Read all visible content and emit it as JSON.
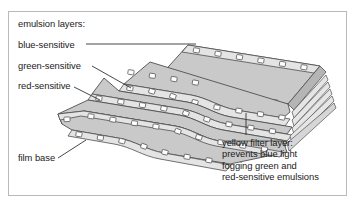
{
  "figure": {
    "border_color": "#b9b9b9",
    "background_color": "#ffffff"
  },
  "labels": {
    "emulsion_layers": "emulsion layers:",
    "blue_sensitive": "blue-sensitive",
    "green_sensitive": "green-sensitive",
    "red_sensitive": "red-sensitive",
    "film_base": "film base",
    "yellow_filter": {
      "line1": "yellow filter layer:",
      "line2": "prevents blue light",
      "line3": "fogging green and",
      "line4": "red-sensitive emulsions"
    }
  },
  "diagram": {
    "type": "exploded-layer-illustration",
    "layer_count": 4,
    "layers": [
      {
        "name": "blue-sensitive",
        "order": 1,
        "fill": "#c9c9c9"
      },
      {
        "name": "green-sensitive",
        "order": 2,
        "fill": "#c9c9c9"
      },
      {
        "name": "red-sensitive",
        "order": 3,
        "fill": "#c9c9c9"
      },
      {
        "name": "film base",
        "order": 4,
        "fill": "#c9c9c9"
      }
    ],
    "colors": {
      "film_fill": "#c9c9c9",
      "film_fill_light": "#e2e2e2",
      "film_edge": "#555555",
      "sprocket_fill": "#ffffff",
      "leader_line": "#333333",
      "text": "#1b1b1b"
    },
    "sprocket_holes_per_edge": 6
  }
}
